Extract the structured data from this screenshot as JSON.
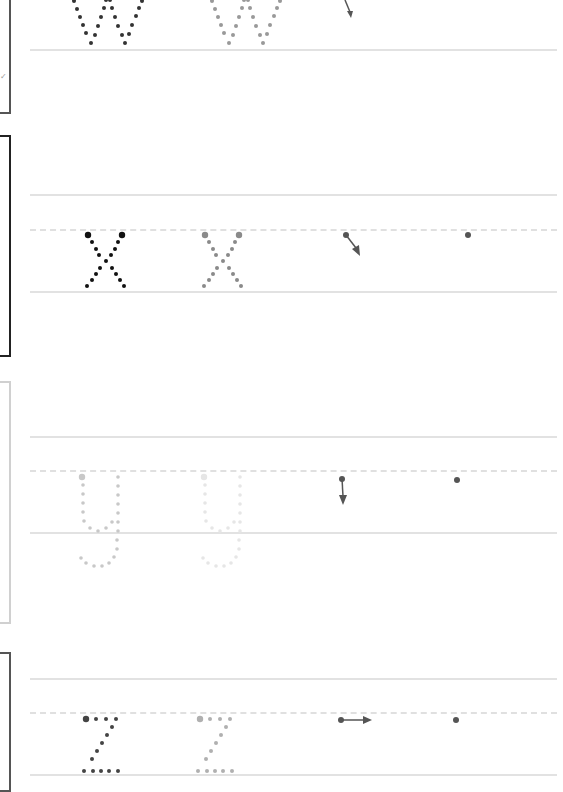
{
  "worksheet": {
    "title": "Letter tracing practice",
    "colors": {
      "dark_dot": "#333333",
      "black_dot": "#111111",
      "mid_dot": "#8a8a8a",
      "light_dot": "#c8c8c8",
      "very_light_dot": "#e6e6e6",
      "guide_line": "#e2e2e2",
      "arrow": "#555555"
    },
    "rows": [
      {
        "letter": "w",
        "frame_color": "#555555",
        "start_arrow": "down-right",
        "partial": "top"
      },
      {
        "letter": "x",
        "frame_color": "#222222",
        "start_arrow": "down-right",
        "extra_start_dot": true
      },
      {
        "letter": "y",
        "frame_color": "#d0d0d0",
        "start_arrow": "down",
        "extra_start_dot": true
      },
      {
        "letter": "z",
        "frame_color": "#555555",
        "start_arrow": "right",
        "extra_start_dot": true,
        "partial": "bottom"
      }
    ]
  }
}
